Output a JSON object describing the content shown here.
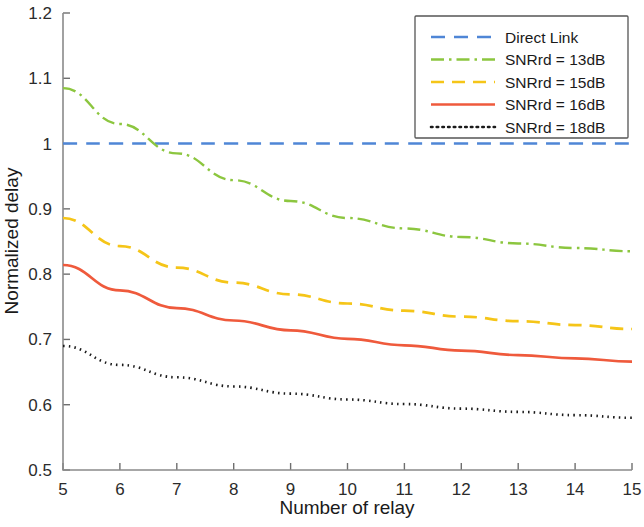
{
  "chart_data": {
    "type": "line",
    "title": "",
    "xlabel": "Number of relay",
    "ylabel": "Normalized delay",
    "xlim": [
      5,
      15
    ],
    "ylim": [
      0.5,
      1.2
    ],
    "xticks": [
      "5",
      "6",
      "7",
      "8",
      "9",
      "10",
      "11",
      "12",
      "13",
      "14",
      "15"
    ],
    "yticks": [
      "0.5",
      "0.6",
      "0.7",
      "0.8",
      "0.9",
      "1",
      "1.1",
      "1.2"
    ],
    "grid": false,
    "legend_position": "top-right",
    "x": [
      5,
      6,
      7,
      8,
      9,
      10,
      11,
      12,
      13,
      14,
      15
    ],
    "series": [
      {
        "name": "Direct Link",
        "color": "#4f86d6",
        "dash": "14,9",
        "width": 2.4,
        "values": [
          1.0,
          1.0,
          1.0,
          1.0,
          1.0,
          1.0,
          1.0,
          1.0,
          1.0,
          1.0,
          1.0
        ]
      },
      {
        "name": "SNRrd = 13dB",
        "color": "#8cc63f",
        "dash": "13,5,2.5,5",
        "width": 2.4,
        "values": [
          1.085,
          1.03,
          0.985,
          0.944,
          0.912,
          0.886,
          0.87,
          0.857,
          0.847,
          0.84,
          0.835
        ]
      },
      {
        "name": "SNRrd = 15dB",
        "color": "#f5c518",
        "dash": "13,8",
        "width": 2.7,
        "values": [
          0.886,
          0.843,
          0.81,
          0.787,
          0.769,
          0.755,
          0.744,
          0.735,
          0.728,
          0.722,
          0.716
        ]
      },
      {
        "name": "SNRrd = 16dB",
        "color": "#ef5a3c",
        "dash": "none",
        "width": 2.7,
        "values": [
          0.814,
          0.775,
          0.748,
          0.729,
          0.714,
          0.701,
          0.691,
          0.683,
          0.676,
          0.671,
          0.666
        ]
      },
      {
        "name": "SNRrd = 18dB",
        "color": "#1a1a1a",
        "dash": "1.5,4.2",
        "width": 2.6,
        "values": [
          0.69,
          0.661,
          0.642,
          0.628,
          0.617,
          0.608,
          0.601,
          0.594,
          0.589,
          0.584,
          0.58
        ]
      }
    ]
  },
  "axes": {
    "x_title": "Number of relay",
    "y_title": "Normalized delay"
  },
  "legend": {
    "entries": [
      {
        "label": "Direct Link"
      },
      {
        "label": "SNRrd = 13dB"
      },
      {
        "label": "SNRrd = 15dB"
      },
      {
        "label": "SNRrd = 16dB"
      },
      {
        "label": "SNRrd = 18dB"
      }
    ]
  }
}
